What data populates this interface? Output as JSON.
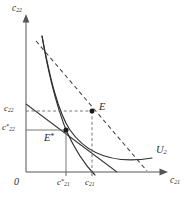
{
  "figure": {
    "type": "economics-indifference-curve-diagram",
    "width": 188,
    "height": 202,
    "background": "#ffffff",
    "ink_color": "#2b2b2b"
  },
  "axes": {
    "y_label": "c",
    "y_label_sub": "22",
    "x_label": "c",
    "x_label_sub": "21",
    "origin_label": "0"
  },
  "ticks": {
    "y": [
      {
        "label": "c",
        "sub": "22",
        "star": "",
        "value_px": 111
      },
      {
        "label": "c",
        "sub": "22",
        "star": "*",
        "value_px": 130
      }
    ],
    "x": [
      {
        "label": "c",
        "sub": "21",
        "star": "*",
        "value_px": 66
      },
      {
        "label": "c",
        "sub": "21",
        "star": "",
        "value_px": 92
      }
    ]
  },
  "points": [
    {
      "name": "E",
      "label": "E",
      "star": "",
      "x_px": 92,
      "y_px": 111,
      "filled": true
    },
    {
      "name": "Estar",
      "label": "E",
      "star": "*",
      "x_px": 66,
      "y_px": 130,
      "filled": true
    }
  ],
  "curves": [
    {
      "name": "U2",
      "label": "U",
      "sub": "2",
      "style": "solid",
      "description": "indifference curve U2 through E*, convex to origin"
    },
    {
      "name": "second_indifference",
      "label": "",
      "sub": "",
      "style": "solid",
      "description": "steeper solid curve through E* descending to lower right"
    },
    {
      "name": "budget_dashed",
      "label": "",
      "sub": "",
      "style": "dashed",
      "description": "dashed budget line tangent at E"
    },
    {
      "name": "budget_solid",
      "label": "",
      "sub": "",
      "style": "solid",
      "description": "solid budget line through E*"
    }
  ],
  "guides": [
    {
      "name": "E-horizontal-guide",
      "style": "dashed"
    },
    {
      "name": "E-vertical-guide",
      "style": "dashed"
    },
    {
      "name": "Estar-horizontal-guide",
      "style": "solid"
    },
    {
      "name": "Estar-vertical-guide",
      "style": "solid"
    }
  ]
}
